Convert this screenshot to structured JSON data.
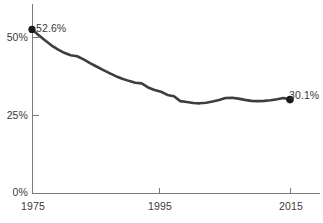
{
  "chart_data": {
    "type": "line",
    "title": "",
    "subtitle": "",
    "xlabel": "",
    "ylabel": "",
    "xlim": [
      1975,
      2016
    ],
    "ylim": [
      0,
      56
    ],
    "grid": false,
    "legend": null,
    "x_tick_labels": [
      "1975",
      "1995",
      "2015"
    ],
    "x_ticks": [
      1975,
      1995,
      2015
    ],
    "y_tick_labels": [
      "0%",
      "25%",
      "50%"
    ],
    "y_ticks": [
      0,
      25,
      50
    ],
    "annotations": [
      {
        "label": "52.6%",
        "x": 1975,
        "y": 52.6,
        "marker": true
      },
      {
        "label": "30.1%",
        "x": 2015,
        "y": 30.1,
        "marker": true
      }
    ],
    "series": [
      {
        "name": "share",
        "color": "#3d3d3d",
        "x": [
          1975,
          1976,
          1977,
          1978,
          1979,
          1980,
          1981,
          1982,
          1983,
          1984,
          1985,
          1986,
          1987,
          1988,
          1989,
          1990,
          1991,
          1992,
          1993,
          1994,
          1995,
          1996,
          1997,
          1998,
          1999,
          2000,
          2001,
          2002,
          2003,
          2004,
          2005,
          2006,
          2007,
          2008,
          2009,
          2010,
          2011,
          2012,
          2013,
          2014,
          2015
        ],
        "values": [
          52.6,
          50.8,
          49.1,
          47.5,
          46.2,
          45.1,
          44.3,
          44.0,
          43.0,
          41.8,
          40.7,
          39.6,
          38.6,
          37.6,
          36.8,
          36.1,
          35.5,
          35.3,
          34.0,
          33.2,
          32.6,
          31.6,
          31.2,
          29.6,
          29.3,
          29.0,
          28.9,
          29.1,
          29.5,
          30.0,
          30.6,
          30.7,
          30.4,
          30.0,
          29.7,
          29.6,
          29.7,
          29.9,
          30.2,
          30.6,
          30.1
        ]
      }
    ]
  },
  "axis_colors": {
    "axis": "#7a7a7a",
    "line": "#3d3d3d",
    "text": "#3a3a3a"
  }
}
